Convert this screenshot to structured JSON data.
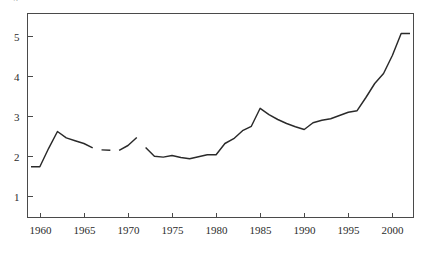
{
  "caption": {
    "clipped_top_text": "Figure"
  },
  "chart_data": {
    "type": "line",
    "title": "",
    "subtitle": "",
    "xlabel": "",
    "ylabel": "",
    "xlim": [
      1958.6,
      2002.4
    ],
    "ylim": [
      0.45,
      5.55
    ],
    "grid": false,
    "legend": null,
    "legend_position": "none",
    "xticks": [
      1960,
      1965,
      1970,
      1975,
      1980,
      1985,
      1990,
      1995,
      2000
    ],
    "xtick_labels": [
      "1960",
      "1965",
      "1970",
      "1975",
      "1980",
      "1985",
      "1990",
      "1995",
      "2000"
    ],
    "yticks": [
      1,
      2,
      3,
      4,
      5
    ],
    "ytick_labels": [
      "1",
      "2",
      "3",
      "4",
      "5"
    ],
    "axes_visible": [
      "left",
      "bottom",
      "top",
      "right"
    ],
    "series": [
      {
        "name": "series-1",
        "color": "#2a2a2a",
        "has_gaps": true,
        "segments": [
          {
            "x": [
              1959,
              1960,
              1961,
              1962,
              1963,
              1964,
              1965,
              1966
            ],
            "y": [
              1.72,
              1.72,
              2.18,
              2.6,
              2.44,
              2.37,
              2.3,
              2.19
            ]
          },
          {
            "x": [
              1967,
              1968
            ],
            "y": [
              2.14,
              2.13
            ]
          },
          {
            "x": [
              1969,
              1970,
              1971
            ],
            "y": [
              2.13,
              2.25,
              2.45
            ]
          },
          {
            "x": [
              1972,
              1973,
              1974,
              1975,
              1976,
              1977,
              1978,
              1979,
              1980,
              1981,
              1982,
              1983,
              1984,
              1985,
              1986,
              1987,
              1988,
              1989,
              1990,
              1991,
              1992,
              1993,
              1994,
              1995,
              1996,
              1997,
              1998,
              1999,
              2000,
              2001,
              2002
            ],
            "y": [
              2.2,
              1.98,
              1.96,
              2.0,
              1.95,
              1.92,
              1.97,
              2.02,
              2.02,
              2.3,
              2.42,
              2.62,
              2.73,
              3.18,
              3.02,
              2.9,
              2.8,
              2.72,
              2.65,
              2.82,
              2.88,
              2.92,
              3.0,
              3.08,
              3.12,
              3.45,
              3.8,
              4.05,
              4.5,
              5.05,
              5.05
            ]
          }
        ]
      }
    ]
  }
}
